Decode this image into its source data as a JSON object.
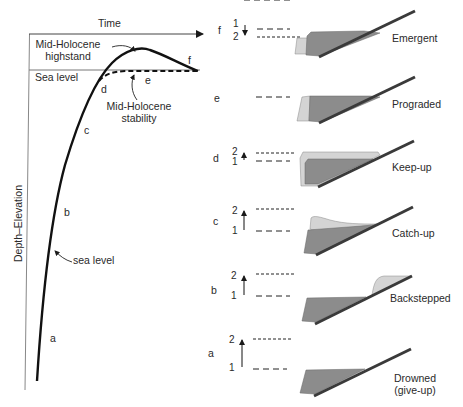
{
  "left_panel": {
    "x_axis_label": "Time",
    "y_axis_label": "Depth–Elevation",
    "sea_level_label": "Sea level",
    "highstand_label_line1": "Mid-Holocene",
    "highstand_label_line2": "highstand",
    "stability_label_line1": "Mid-Holocene",
    "stability_label_line2": "stability",
    "curve_label": "sea level",
    "stage_labels": [
      "a",
      "b",
      "c",
      "d",
      "e",
      "f"
    ]
  },
  "right_panel": {
    "scenarios": [
      {
        "stage": "f",
        "name": "Emergent",
        "marks": [
          "1",
          "2"
        ],
        "arrow": "down"
      },
      {
        "stage": "e",
        "name": "Prograded",
        "marks": [],
        "arrow": "none"
      },
      {
        "stage": "d",
        "name": "Keep-up",
        "marks": [
          "2",
          "1"
        ],
        "arrow": "up-short"
      },
      {
        "stage": "c",
        "name": "Catch-up",
        "marks": [
          "2",
          "1"
        ],
        "arrow": "up-long"
      },
      {
        "stage": "b",
        "name": "Backstepped",
        "marks": [
          "2",
          "1"
        ],
        "arrow": "up-long"
      },
      {
        "stage": "a",
        "name": "Drowned",
        "name_line2": "(give-up)",
        "marks": [
          "2",
          "1"
        ],
        "arrow": "up-long"
      }
    ]
  },
  "colors": {
    "ink": "#1a1a1a",
    "dark_fill": "#8c8c8c",
    "light_fill": "#d4d4d4",
    "slope": "#3a3a3a"
  }
}
